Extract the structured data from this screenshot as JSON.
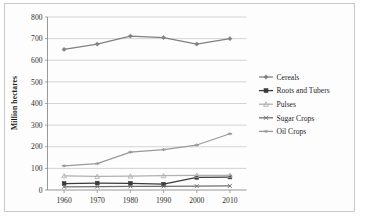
{
  "chart_data": {
    "type": "line",
    "title": "",
    "xlabel": "",
    "ylabel": "Million hectares",
    "categories": [
      "1960",
      "1970",
      "1980",
      "1990",
      "2000",
      "2010"
    ],
    "x": [
      1960,
      1970,
      1980,
      1990,
      2000,
      2010
    ],
    "ylim": [
      0,
      800
    ],
    "ytick_labels": [
      "0",
      "100",
      "200",
      "300",
      "400",
      "500",
      "600",
      "700",
      "800"
    ],
    "yticks": [
      0,
      100,
      200,
      300,
      400,
      500,
      600,
      700,
      800
    ],
    "grid": true,
    "legend_position": "right",
    "series": [
      {
        "name": "Cereals",
        "marker": "diamond",
        "color": "#808080",
        "values": [
          650,
          675,
          712,
          705,
          675,
          700
        ]
      },
      {
        "name": "Roots and Tubers",
        "marker": "square",
        "color": "#3a3a3a",
        "values": [
          30,
          32,
          31,
          27,
          58,
          60
        ]
      },
      {
        "name": "Pulses",
        "marker": "triangle",
        "color": "#b0b0b0",
        "values": [
          65,
          63,
          64,
          66,
          68,
          68
        ]
      },
      {
        "name": "Sugar Crops",
        "marker": "x",
        "color": "#6e6e6e",
        "values": [
          15,
          16,
          17,
          17,
          18,
          19
        ]
      },
      {
        "name": "Oil Crops",
        "marker": "dash",
        "color": "#9a9a9a",
        "values": [
          112,
          122,
          175,
          187,
          208,
          260
        ]
      }
    ]
  },
  "axes": {
    "y_title": "Million hectares"
  },
  "legend": {
    "items": [
      {
        "label": "Cereals"
      },
      {
        "label": "Roots and Tubers"
      },
      {
        "label": "Pulses"
      },
      {
        "label": "Sugar Crops"
      },
      {
        "label": "Oil Crops"
      }
    ]
  },
  "colors": {
    "grid": "#c2c2c2",
    "axis": "#8d8d8d",
    "frame": "#c9c9c9",
    "text": "#1f1f1f",
    "background": "#ffffff"
  }
}
